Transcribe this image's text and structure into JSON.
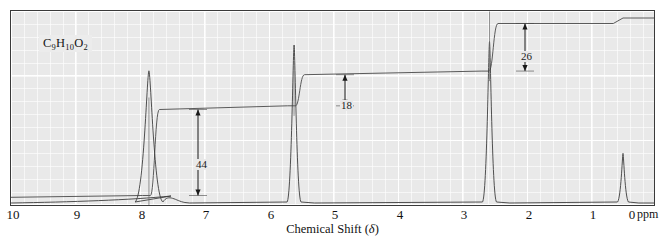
{
  "figure": {
    "formula_label": "C9H10O2",
    "formula_parts": [
      {
        "text": "C",
        "sub": false
      },
      {
        "text": "9",
        "sub": true
      },
      {
        "text": "H",
        "sub": false
      },
      {
        "text": "10",
        "sub": true
      },
      {
        "text": "O",
        "sub": false
      },
      {
        "text": "2",
        "sub": true
      }
    ],
    "axis_title_prefix": "Chemical Shift (",
    "axis_title_delta": "δ",
    "axis_title_suffix": ")",
    "unit_label": "ppm",
    "frame_color": "#3a3a3a",
    "plot_bg": "#e9e9e9",
    "grid_color": "#ffffff",
    "trace_color": "#3d3d3d",
    "integral_color": "#4a4a4a",
    "annotation_color": "#1a1a1a"
  },
  "chart_data": {
    "type": "line",
    "title": "",
    "subtitle": "",
    "xlabel": "Chemical Shift (δ)",
    "ylabel": "",
    "xunit": "ppm",
    "xlim": [
      10,
      0
    ],
    "x_axis_inverted": true,
    "grid": true,
    "grid_major_step": 1,
    "grid_minor_step": 0.2,
    "legend_position": "none",
    "tick_labels": [
      "10",
      "9",
      "8",
      "7",
      "6",
      "5",
      "4",
      "3",
      "2",
      "1",
      "0"
    ],
    "tick_values": [
      10,
      9,
      8,
      7,
      6,
      5,
      4,
      3,
      2,
      1,
      0
    ],
    "annotation_formula": "C9H10O2",
    "peaks": [
      {
        "shift_ppm": 7.35,
        "label": "aromatic",
        "relative_height": 0.78,
        "multiplicity": "multiplet",
        "width_ppm": 0.09
      },
      {
        "shift_ppm": 5.1,
        "label": "OCH2",
        "relative_height": 0.93,
        "multiplicity": "singlet",
        "width_ppm": 0.045
      },
      {
        "shift_ppm": 2.07,
        "label": "CH3",
        "relative_height": 0.95,
        "multiplicity": "singlet",
        "width_ppm": 0.045
      },
      {
        "shift_ppm": 0.0,
        "label": "TMS",
        "relative_height": 0.3,
        "multiplicity": "singlet",
        "width_ppm": 0.035
      }
    ],
    "integration_steps": [
      {
        "value": "44",
        "shift_ppm": 7.35,
        "label_shift_ppm": 7.05,
        "assigned_protons": 5
      },
      {
        "value": "18",
        "shift_ppm": 5.1,
        "label_shift_ppm": 4.78,
        "assigned_protons": 2
      },
      {
        "value": "26",
        "shift_ppm": 2.07,
        "label_shift_ppm": 1.76,
        "assigned_protons": 3
      }
    ],
    "integral_trace_levels": [
      {
        "shift_ppm": 10.0,
        "level": 0.02
      },
      {
        "shift_ppm": 7.45,
        "level": 0.03
      },
      {
        "shift_ppm": 7.25,
        "level": 0.5
      },
      {
        "shift_ppm": 5.2,
        "level": 0.52
      },
      {
        "shift_ppm": 5.0,
        "level": 0.69
      },
      {
        "shift_ppm": 2.2,
        "level": 0.71
      },
      {
        "shift_ppm": 2.0,
        "level": 0.97
      },
      {
        "shift_ppm": 0.15,
        "level": 0.97
      },
      {
        "shift_ppm": 0.0,
        "level": 1.0
      }
    ]
  },
  "integral_labels": [
    {
      "value": "44",
      "x_px": 186,
      "y_px": 155
    },
    {
      "value": "18",
      "x_px": 333,
      "y_px": 96
    },
    {
      "value": "26",
      "x_px": 513,
      "y_px": 48
    }
  ],
  "axis_tick_positions": [
    {
      "label": "10",
      "x_px": 3
    },
    {
      "label": "9",
      "x_px": 67
    },
    {
      "label": "8",
      "x_px": 132
    },
    {
      "label": "7",
      "x_px": 196
    },
    {
      "label": "6",
      "x_px": 261
    },
    {
      "label": "5",
      "x_px": 325
    },
    {
      "label": "4",
      "x_px": 390
    },
    {
      "label": "3",
      "x_px": 454
    },
    {
      "label": "2",
      "x_px": 519
    },
    {
      "label": "1",
      "x_px": 583
    },
    {
      "label": "0",
      "x_px": 622
    }
  ]
}
